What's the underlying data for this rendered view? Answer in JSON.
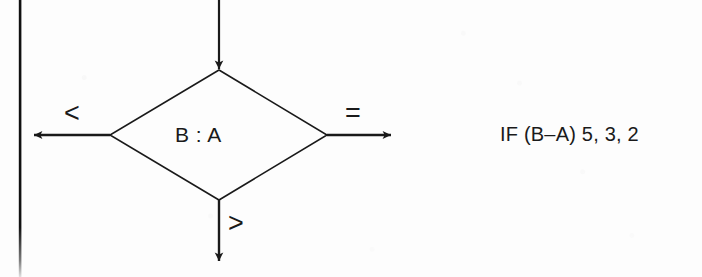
{
  "figure": {
    "type": "flowchart-decision",
    "background_color": "#fdfdfd",
    "ink_color": "#1a1a1a",
    "margin_rule": {
      "name": "page-margin-rule",
      "orientation": "vertical",
      "x": 20,
      "color": "#111111"
    },
    "decision": {
      "label": "B : A",
      "shape": "diamond",
      "left_vertex_x": 110,
      "right_vertex_x": 327,
      "top_vertex_y": 70,
      "bottom_vertex_y": 200,
      "center_x": 219,
      "center_y": 135
    },
    "entry_arrow": {
      "name": "entry-arrow-top",
      "direction": "down",
      "from_y": 0,
      "to_y": 70
    },
    "branches": [
      {
        "id": "less-than",
        "label": "<",
        "direction": "left",
        "arrow_tip_x": 33,
        "arrow_y": 135
      },
      {
        "id": "equal",
        "label": "=",
        "direction": "right",
        "arrow_tip_x": 392,
        "arrow_y": 135
      },
      {
        "id": "greater-than",
        "label": ">",
        "direction": "down",
        "arrow_tip_y": 262,
        "arrow_x": 219
      }
    ],
    "annotation": {
      "text": "IF (B–A) 5, 3, 2"
    }
  }
}
